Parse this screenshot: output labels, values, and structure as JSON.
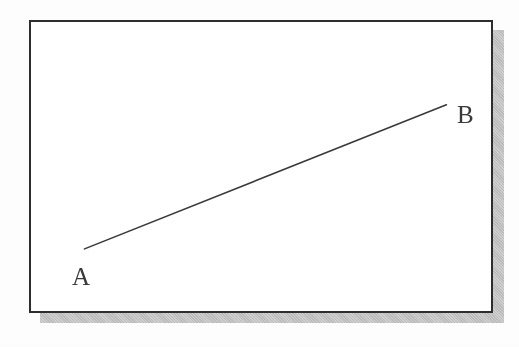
{
  "figure": {
    "type": "line-diagram",
    "background_color": "#fdfdfd",
    "frame": {
      "name": "rectangular-border",
      "border_color": "#2e2e2e",
      "border_width_px": 2,
      "fill_color": "#ffffff",
      "x": 29,
      "y": 20,
      "width": 464,
      "height": 293
    },
    "shadow": {
      "name": "drop-shadow",
      "color": "#b9b9b9",
      "offset_x": 11,
      "offset_y": 10
    },
    "line": {
      "name": "segment-ab",
      "color": "#3a3a3a",
      "stroke_width_px": 1.6,
      "start": {
        "label": "A",
        "x": 83,
        "y": 250
      },
      "end": {
        "label": "B",
        "x": 448,
        "y": 104
      }
    },
    "labels": [
      {
        "id": "a",
        "text": "A",
        "x": 70,
        "y": 262
      },
      {
        "id": "b",
        "text": "B",
        "x": 455,
        "y": 100
      }
    ]
  },
  "chart_data": {
    "type": "line",
    "title": "",
    "subtitle": "",
    "xlabel": "",
    "ylabel": "",
    "grid": false,
    "legend": "none",
    "annotations": [
      "A",
      "B"
    ],
    "series": [
      {
        "name": "AB",
        "points": [
          {
            "label": "A",
            "x": 83,
            "y": 250
          },
          {
            "label": "B",
            "x": 448,
            "y": 104
          }
        ]
      }
    ],
    "x": [
      83,
      448
    ],
    "values": [
      250,
      104
    ],
    "xlim": [
      29,
      493
    ],
    "ylim": [
      20,
      313
    ]
  }
}
